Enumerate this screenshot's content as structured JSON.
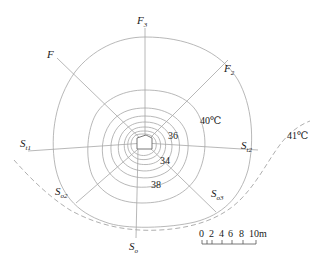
{
  "diagram": {
    "type": "temperature-contour-map",
    "center": {
      "x": 145,
      "y": 143
    },
    "rays": [
      {
        "id": "F3",
        "label": "F",
        "subscript": "3",
        "direction": "north"
      },
      {
        "id": "F2",
        "label": "F",
        "subscript": "2",
        "direction": "north-east"
      },
      {
        "id": "F",
        "label": "F",
        "subscript": "",
        "direction": "north-west"
      },
      {
        "id": "St1",
        "label": "S",
        "subscript": "t1",
        "direction": "west"
      },
      {
        "id": "St2",
        "label": "S",
        "subscript": "t2",
        "direction": "east"
      },
      {
        "id": "So2",
        "label": "S",
        "subscript": "o2",
        "direction": "south-west"
      },
      {
        "id": "So3",
        "label": "S",
        "subscript": "o3",
        "direction": "south-east"
      },
      {
        "id": "So",
        "label": "S",
        "subscript": "o",
        "direction": "south"
      }
    ],
    "contour_labels": {
      "c36": "36",
      "c34": "34",
      "c38": "38",
      "c40": "40℃",
      "c41": "41℃"
    },
    "scale_bar": {
      "ticks": [
        "0",
        "2",
        "4",
        "6",
        "8",
        "10m"
      ]
    }
  }
}
